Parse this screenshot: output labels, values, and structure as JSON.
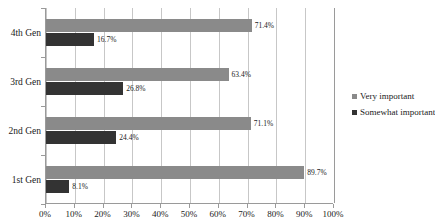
{
  "chart_data": {
    "type": "bar",
    "orientation": "horizontal",
    "title": "",
    "xlabel": "",
    "ylabel": "",
    "categories": [
      "4th Gen",
      "3rd Gen",
      "2nd Gen",
      "1st Gen"
    ],
    "series": [
      {
        "name": "Very important",
        "color": "#8a8a8a",
        "values": [
          71.4,
          63.4,
          71.1,
          89.7
        ],
        "labels": [
          "71.4%",
          "63.4%",
          "71.1%",
          "89.7%"
        ]
      },
      {
        "name": "Somewhat important",
        "color": "#333333",
        "values": [
          16.7,
          26.8,
          24.4,
          8.1
        ],
        "labels": [
          "16.7%",
          "26.8%",
          "24.4%",
          "8.1%"
        ]
      }
    ],
    "xlim": [
      0,
      100
    ],
    "xticks": [
      0,
      10,
      20,
      30,
      40,
      50,
      60,
      70,
      80,
      90,
      100
    ],
    "xtick_labels": [
      "0%",
      "10%",
      "20%",
      "30%",
      "40%",
      "50%",
      "60%",
      "70%",
      "80%",
      "90%",
      "100%"
    ],
    "grid": true,
    "grid_axis": "x",
    "legend_position": "right"
  },
  "legend": {
    "entries": [
      {
        "label": "Very important"
      },
      {
        "label": "Somewhat important"
      }
    ]
  }
}
